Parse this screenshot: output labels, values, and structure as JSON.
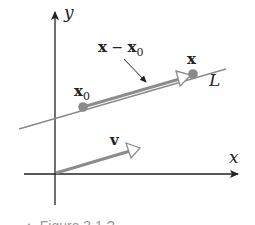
{
  "diagram": {
    "axes": {
      "x_label": "x",
      "y_label": "y"
    },
    "line": {
      "label": "L"
    },
    "points": {
      "x0": {
        "base": "x",
        "sub": "0"
      },
      "x": {
        "base": "x"
      }
    },
    "vectors": {
      "difference": {
        "label_a": "x",
        "minus": " − ",
        "label_b": "x",
        "label_b_sub": "0"
      },
      "v": {
        "label": "v"
      }
    },
    "colors": {
      "axis": "#222222",
      "line_L": "#8a8a8a",
      "vector_gray": "#8c8c8c",
      "point_fill": "#8a8a8a"
    },
    "caption": "▲ Figure 3.1.?"
  }
}
